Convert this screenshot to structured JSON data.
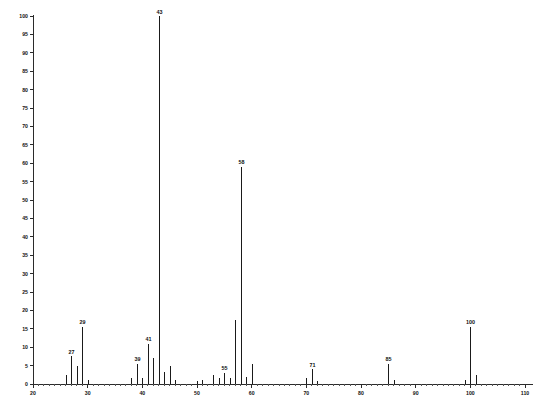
{
  "chart_data": {
    "type": "bar",
    "title": "",
    "subtitle": "",
    "xlabel": "",
    "ylabel": "",
    "xlim": [
      20,
      110
    ],
    "ylim": [
      0,
      100
    ],
    "grid": false,
    "legend": null,
    "x_ticks": [
      20,
      30,
      40,
      50,
      60,
      70,
      80,
      90,
      100,
      110
    ],
    "x_tick_labels": [
      "20",
      "30",
      "40",
      "50",
      "60",
      "70",
      "80",
      "90",
      "100",
      "110"
    ],
    "x_minor_tick_step": 1,
    "y_ticks": [
      0,
      5,
      10,
      15,
      20,
      25,
      30,
      35,
      40,
      45,
      50,
      55,
      60,
      65,
      70,
      75,
      80,
      85,
      90,
      95,
      100
    ],
    "y_tick_labels": [
      "0",
      "5",
      "10",
      "15",
      "20",
      "25",
      "30",
      "35",
      "40",
      "45",
      "50",
      "55",
      "60",
      "65",
      "70",
      "75",
      "80",
      "85",
      "90",
      "95",
      "100"
    ],
    "series_name": "relative intensity",
    "x": [
      26,
      27,
      28,
      29,
      30,
      38,
      39,
      40,
      41,
      42,
      43,
      44,
      45,
      46,
      50,
      51,
      53,
      54,
      55,
      56,
      57,
      58,
      59,
      60,
      70,
      71,
      72,
      85,
      86,
      99,
      100,
      101
    ],
    "values": [
      2.5,
      7.5,
      5.0,
      15.5,
      1.2,
      1.5,
      5.5,
      1.5,
      11.0,
      7.0,
      100.0,
      3.2,
      5.0,
      1.0,
      0.8,
      1.0,
      2.5,
      1.5,
      3.0,
      1.5,
      17.5,
      59.0,
      2.0,
      5.5,
      1.5,
      4.0,
      0.8,
      5.5,
      1.0,
      1.2,
      15.5,
      2.5
    ],
    "labeled_peaks": [
      {
        "mz": 27,
        "intensity": 7.5,
        "label": "27"
      },
      {
        "mz": 29,
        "intensity": 15.5,
        "label": "29"
      },
      {
        "mz": 39,
        "intensity": 5.5,
        "label": "39"
      },
      {
        "mz": 41,
        "intensity": 11.0,
        "label": "41"
      },
      {
        "mz": 43,
        "intensity": 100.0,
        "label": "43"
      },
      {
        "mz": 55,
        "intensity": 3.0,
        "label": "55"
      },
      {
        "mz": 58,
        "intensity": 59.0,
        "label": "58"
      },
      {
        "mz": 71,
        "intensity": 4.0,
        "label": "71"
      },
      {
        "mz": 85,
        "intensity": 5.5,
        "label": "85"
      },
      {
        "mz": 100,
        "intensity": 15.5,
        "label": "100"
      }
    ],
    "base_peak_mz": 43,
    "colors": {
      "axis": "#2b2b2b",
      "peak": "#1a1a1a",
      "text": "#111111",
      "background": "#ffffff"
    }
  },
  "geometry": {
    "plot_left": 33,
    "plot_right": 525,
    "plot_bottom": 384,
    "plot_top": 16,
    "px_per_mz": 5.47,
    "mz_at_left": 20
  }
}
